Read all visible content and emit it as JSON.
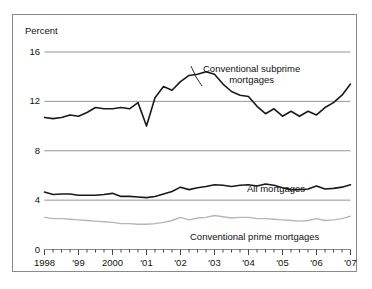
{
  "chart_data": {
    "type": "line",
    "title": "",
    "xlabel": "",
    "ylabel": "Percent",
    "ylim": [
      0,
      16
    ],
    "yticks": [
      0,
      4,
      8,
      12,
      16
    ],
    "ytick_labels": [
      "0",
      "4",
      "8",
      "12",
      "16"
    ],
    "xlim": [
      1998.0,
      2007.0
    ],
    "xticks": [
      1998,
      1999,
      2000,
      2001,
      2002,
      2003,
      2004,
      2005,
      2006,
      2007
    ],
    "xtick_labels": [
      "1998",
      "'99",
      "2000",
      "'01",
      "'02",
      "'03",
      "'04",
      "'05",
      "'06",
      "'07"
    ],
    "minor_tick_interval": 0.25,
    "grid": "horizontal",
    "legend_position": "inline-annotations",
    "series": [
      {
        "name": "Conventional subprime mortgages",
        "color": "#1a1a1a",
        "width": 1.6,
        "x": [
          1998.0,
          1998.25,
          1998.5,
          1998.75,
          1999.0,
          1999.25,
          1999.5,
          1999.75,
          2000.0,
          2000.25,
          2000.5,
          2000.75,
          2001.0,
          2001.25,
          2001.5,
          2001.75,
          2002.0,
          2002.25,
          2002.5,
          2002.75,
          2003.0,
          2003.25,
          2003.5,
          2003.75,
          2004.0,
          2004.25,
          2004.5,
          2004.75,
          2005.0,
          2005.25,
          2005.5,
          2005.75,
          2006.0,
          2006.25,
          2006.5,
          2006.75,
          2007.0
        ],
        "values": [
          10.7,
          10.6,
          10.7,
          10.9,
          10.8,
          11.1,
          11.5,
          11.4,
          11.4,
          11.5,
          11.4,
          11.9,
          10.0,
          12.3,
          13.2,
          12.9,
          13.6,
          14.1,
          14.2,
          14.4,
          14.2,
          13.4,
          12.8,
          12.5,
          12.4,
          11.6,
          11.0,
          11.4,
          10.8,
          11.2,
          10.8,
          11.2,
          10.9,
          11.5,
          11.9,
          12.5,
          13.4
        ]
      },
      {
        "name": "All mortgages",
        "color": "#1a1a1a",
        "width": 1.6,
        "x": [
          1998.0,
          1998.25,
          1998.5,
          1998.75,
          1999.0,
          1999.25,
          1999.5,
          1999.75,
          2000.0,
          2000.25,
          2000.5,
          2000.75,
          2001.0,
          2001.25,
          2001.5,
          2001.75,
          2002.0,
          2002.25,
          2002.5,
          2002.75,
          2003.0,
          2003.25,
          2003.5,
          2003.75,
          2004.0,
          2004.25,
          2004.5,
          2004.75,
          2005.0,
          2005.25,
          2005.5,
          2005.75,
          2006.0,
          2006.25,
          2006.5,
          2006.75,
          2007.0
        ],
        "values": [
          4.65,
          4.45,
          4.5,
          4.5,
          4.4,
          4.4,
          4.4,
          4.45,
          4.55,
          4.3,
          4.3,
          4.25,
          4.2,
          4.3,
          4.5,
          4.7,
          5.05,
          4.85,
          5.0,
          5.1,
          5.25,
          5.2,
          5.1,
          5.2,
          5.25,
          5.15,
          5.3,
          5.2,
          5.0,
          4.85,
          4.85,
          4.9,
          5.15,
          4.9,
          4.95,
          5.05,
          5.25
        ]
      },
      {
        "name": "Conventional prime mortgages",
        "color": "#b6b6b6",
        "width": 1.4,
        "x": [
          1998.0,
          1998.25,
          1998.5,
          1998.75,
          1999.0,
          1999.25,
          1999.5,
          1999.75,
          2000.0,
          2000.25,
          2000.5,
          2000.75,
          2001.0,
          2001.25,
          2001.5,
          2001.75,
          2002.0,
          2002.25,
          2002.5,
          2002.75,
          2003.0,
          2003.25,
          2003.5,
          2003.75,
          2004.0,
          2004.25,
          2004.5,
          2004.75,
          2005.0,
          2005.25,
          2005.5,
          2005.75,
          2006.0,
          2006.25,
          2006.5,
          2006.75,
          2007.0
        ],
        "values": [
          2.6,
          2.5,
          2.5,
          2.45,
          2.4,
          2.35,
          2.3,
          2.25,
          2.2,
          2.1,
          2.1,
          2.05,
          2.05,
          2.1,
          2.2,
          2.35,
          2.6,
          2.4,
          2.55,
          2.6,
          2.75,
          2.65,
          2.55,
          2.6,
          2.6,
          2.5,
          2.5,
          2.45,
          2.4,
          2.35,
          2.3,
          2.35,
          2.5,
          2.35,
          2.4,
          2.5,
          2.7
        ]
      }
    ],
    "annotations": [
      {
        "text_line1": "Conventional subprime",
        "text_line2": "mortgages",
        "series": "Conventional subprime mortgages"
      },
      {
        "text_line1": "All mortgages",
        "text_line2": "",
        "series": "All mortgages"
      },
      {
        "text_line1": "Conventional prime mortgages",
        "text_line2": "",
        "series": "Conventional prime mortgages"
      }
    ]
  },
  "axis": {
    "y_title": "Percent",
    "y_labels": [
      "16",
      "12",
      "8",
      "4",
      "0"
    ],
    "x_labels": [
      "1998",
      "'99",
      "2000",
      "'01",
      "'02",
      "'03",
      "'04",
      "'05",
      "'06",
      "'07"
    ]
  },
  "labels": {
    "subprime_line1": "Conventional subprime",
    "subprime_line2": "mortgages",
    "all_mortgages": "All mortgages",
    "prime": "Conventional prime mortgages"
  },
  "colors": {
    "dark_line": "#1a1a1a",
    "light_line": "#b6b6b6",
    "gridline": "#8a8a8a",
    "frame": "#8a8a8a",
    "background": "#ffffff"
  }
}
